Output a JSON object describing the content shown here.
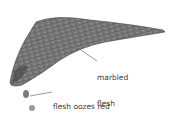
{
  "illustration": {
    "subject": "fish fillet",
    "colors": {
      "flesh_dark": "#4a4a4a",
      "flesh_mid": "#7a7a7a",
      "flesh_light": "#a8a8a8",
      "droplet": "#8a8a8a",
      "leader_line": "#555555",
      "text": "#3a3a3a",
      "background": "#ffffff"
    }
  },
  "labels": {
    "marbled": {
      "line1": "marbled",
      "line2": "flesh"
    },
    "droplets": {
      "line1": "flesh oozes red",
      "line2": "droplets"
    }
  }
}
